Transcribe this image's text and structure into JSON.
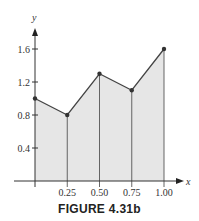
{
  "chart_data": {
    "type": "area",
    "title": "",
    "xlabel": "x",
    "ylabel": "y",
    "x": [
      0,
      0.25,
      0.5,
      0.75,
      1.0
    ],
    "series": [
      {
        "name": "f(x)",
        "values": [
          1.0,
          0.8,
          1.3,
          1.1,
          1.6
        ]
      }
    ],
    "x_ticks": [
      "0.25",
      "0.50",
      "0.75",
      "1.00"
    ],
    "y_ticks": [
      "0.4",
      "0.8",
      "1.2",
      "1.6"
    ],
    "xlim": [
      0,
      1.0
    ],
    "ylim": [
      0,
      1.7
    ],
    "grid": false,
    "legend": "none",
    "vertical_partition_lines": true,
    "fill_color": "#e6e6e6",
    "line_color": "#444444"
  },
  "figure": {
    "caption": "FIGURE 4.31b"
  }
}
